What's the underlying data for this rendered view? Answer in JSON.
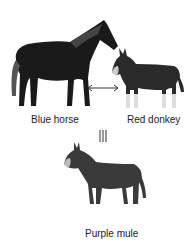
{
  "labels": {
    "horse": "Blue horse",
    "donkey": "Red donkey",
    "mule": "Purple mule"
  },
  "symbols": {
    "cross": "↔",
    "equals": "|||"
  }
}
